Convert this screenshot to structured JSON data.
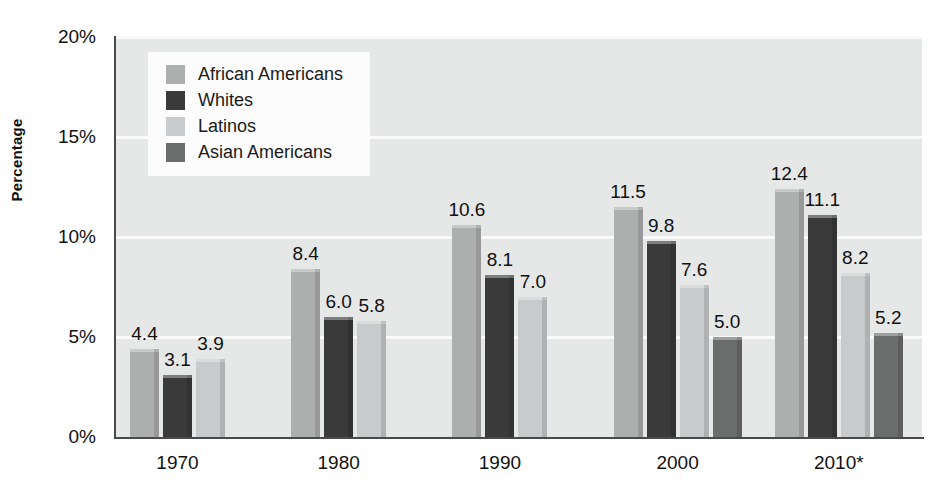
{
  "chart_data": {
    "type": "bar",
    "title": "",
    "subtitle": "",
    "xlabel": "",
    "ylabel": "Percentage",
    "categories": [
      "1970",
      "1980",
      "1990",
      "2000",
      "2010*"
    ],
    "ylim": [
      0,
      20
    ],
    "ytick_values": [
      0,
      5,
      10,
      15,
      20
    ],
    "ytick_labels": [
      "0%",
      "5%",
      "10%",
      "15%",
      "20%"
    ],
    "grid": true,
    "legend_position": "top-left-inside",
    "value_labels_shown": true,
    "series": [
      {
        "name": "African Americans",
        "color": "#adaeae",
        "values": [
          4.4,
          8.4,
          10.6,
          11.5,
          12.4
        ],
        "labels": [
          "4.4",
          "8.4",
          "10.6",
          "11.5",
          "12.4"
        ]
      },
      {
        "name": "Whites",
        "color": "#3a3a3a",
        "values": [
          3.1,
          6.0,
          8.1,
          9.8,
          11.1
        ],
        "labels": [
          "3.1",
          "6.0",
          "8.1",
          "9.8",
          "11.1"
        ]
      },
      {
        "name": "Latinos",
        "color": "#c9cacb",
        "values": [
          3.9,
          5.8,
          7.0,
          7.6,
          8.2
        ],
        "labels": [
          "3.9",
          "5.8",
          "7.0",
          "7.6",
          "8.2"
        ]
      },
      {
        "name": "Asian Americans",
        "color": "#6b6c6c",
        "values": [
          null,
          null,
          null,
          5.0,
          5.2
        ],
        "labels": [
          "",
          "",
          "",
          "5.0",
          "5.2"
        ]
      }
    ],
    "plot_background": "#e6e7e7",
    "gridline_color": "#fbfbfb",
    "axis_color": "#4a4a4a",
    "text_color": "#111111",
    "legend_background": "#fcfcfc"
  }
}
